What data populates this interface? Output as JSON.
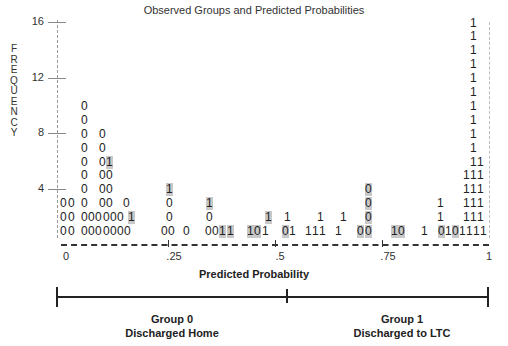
{
  "chart_data": {
    "type": "classification-plot",
    "title": "Observed Groups and Predicted Probabilities",
    "xlabel": "Predicted Probability",
    "ylabel": "FREQUENCY",
    "xlim": [
      0,
      1
    ],
    "ylim": [
      0,
      16
    ],
    "x_ticks": [
      "0",
      ".25",
      ".5",
      ".75",
      "1"
    ],
    "y_ticks": [
      "4",
      "8",
      "12",
      "16"
    ],
    "legend_symbols": {
      "0": "Group 0 (Discharged Home)",
      "1": "Group 1 (Discharged to LTC)"
    },
    "highlight_color": "#c8c8c8",
    "columns": [
      {
        "col": 0,
        "stack": "000"
      },
      {
        "col": 1,
        "stack": "000"
      },
      {
        "col": 2,
        "stack": "0000000000"
      },
      {
        "col": 3,
        "stack": "00"
      },
      {
        "col": 4,
        "stack": "00"
      },
      {
        "col": 5,
        "stack": "00000000"
      },
      {
        "col": 6,
        "stack": "0000001"
      },
      {
        "col": 7,
        "stack": "000"
      },
      {
        "col": 8,
        "stack": "001"
      },
      {
        "col": 13,
        "stack": "0001"
      },
      {
        "col": 14,
        "stack": "0"
      },
      {
        "col": 16,
        "stack": "0"
      },
      {
        "col": 19,
        "stack": "0001"
      },
      {
        "col": 20,
        "stack": "0"
      },
      {
        "col": 21,
        "stack": "1"
      },
      {
        "col": 22,
        "stack": "1"
      },
      {
        "col": 25,
        "stack": "1"
      },
      {
        "col": 26,
        "stack": "0"
      },
      {
        "col": 27,
        "stack": "11"
      },
      {
        "col": 29,
        "stack": "0"
      },
      {
        "col": 30,
        "stack": "11"
      },
      {
        "col": 33,
        "stack": "1"
      },
      {
        "col": 34,
        "stack": "11"
      },
      {
        "col": 35,
        "stack": "1"
      },
      {
        "col": 37,
        "stack": "11"
      },
      {
        "col": 39,
        "stack": "0"
      },
      {
        "col": 40,
        "stack": "0000"
      },
      {
        "col": 44,
        "stack": "1"
      },
      {
        "col": 45,
        "stack": "0"
      },
      {
        "col": 48,
        "stack": "1"
      },
      {
        "col": 50,
        "stack": "0111"
      },
      {
        "col": 51,
        "stack": "1"
      },
      {
        "col": 52,
        "stack": "0"
      },
      {
        "col": 53,
        "stack": "11111111"
      },
      {
        "col": 54,
        "stack": "11111111111111"
      },
      {
        "col": 55,
        "stack": "11111"
      },
      {
        "col": 56,
        "stack": "1"
      }
    ],
    "groups": [
      {
        "range": [
          0,
          0.5
        ],
        "label": "Group 0",
        "sublabel": "Discharged Home"
      },
      {
        "range": [
          0.5,
          1
        ],
        "label": "Group 1",
        "sublabel": "Discharged to LTC"
      }
    ]
  },
  "grid": [
    {
      "x": 84,
      "r": 10,
      "c": "0"
    },
    {
      "x": 84,
      "r": 9,
      "c": "0"
    },
    {
      "x": 84,
      "r": 8,
      "c": "0"
    },
    {
      "x": 84,
      "r": 7,
      "c": "0"
    },
    {
      "x": 84,
      "r": 6,
      "c": "0"
    },
    {
      "x": 84,
      "r": 5,
      "c": "0"
    },
    {
      "x": 84,
      "r": 4,
      "c": "0"
    },
    {
      "x": 84,
      "r": 3,
      "c": "0"
    },
    {
      "x": 84,
      "r": 2,
      "c": "0"
    },
    {
      "x": 84,
      "r": 1,
      "c": "0"
    },
    {
      "x": 63,
      "r": 3,
      "c": "0"
    },
    {
      "x": 63,
      "r": 2,
      "c": "0"
    },
    {
      "x": 63,
      "r": 1,
      "c": "0"
    },
    {
      "x": 71,
      "r": 3,
      "c": "0"
    },
    {
      "x": 71,
      "r": 2,
      "c": "0"
    },
    {
      "x": 71,
      "r": 1,
      "c": "0"
    },
    {
      "x": 91,
      "r": 2,
      "c": "0"
    },
    {
      "x": 91,
      "r": 1,
      "c": "0"
    },
    {
      "x": 98,
      "r": 2,
      "c": "0"
    },
    {
      "x": 98,
      "r": 1,
      "c": "0"
    },
    {
      "x": 102,
      "r": 8,
      "c": "0"
    },
    {
      "x": 102,
      "r": 7,
      "c": "0"
    },
    {
      "x": 102,
      "r": 6,
      "c": "0"
    },
    {
      "x": 102,
      "r": 5,
      "c": "0"
    },
    {
      "x": 102,
      "r": 4,
      "c": "0"
    },
    {
      "x": 102,
      "r": 3,
      "c": "0"
    },
    {
      "x": 106,
      "r": 2,
      "c": "0"
    },
    {
      "x": 106,
      "r": 1,
      "c": "0"
    },
    {
      "x": 109,
      "r": 6,
      "c": "1",
      "hl": true
    },
    {
      "x": 109,
      "r": 5,
      "c": "0"
    },
    {
      "x": 109,
      "r": 4,
      "c": "0"
    },
    {
      "x": 109,
      "r": 3,
      "c": "0"
    },
    {
      "x": 113,
      "r": 2,
      "c": "0"
    },
    {
      "x": 113,
      "r": 1,
      "c": "0"
    },
    {
      "x": 120,
      "r": 2,
      "c": "0"
    },
    {
      "x": 120,
      "r": 1,
      "c": "0"
    },
    {
      "x": 126,
      "r": 3,
      "c": "0"
    },
    {
      "x": 127,
      "r": 1,
      "c": "0"
    },
    {
      "x": 131,
      "r": 2,
      "c": "1",
      "hl": true
    },
    {
      "x": 164,
      "r": 1,
      "c": "0"
    },
    {
      "x": 171,
      "r": 1,
      "c": "0"
    },
    {
      "x": 169,
      "r": 4,
      "c": "1",
      "hl": true
    },
    {
      "x": 169,
      "r": 3,
      "c": "0"
    },
    {
      "x": 169,
      "r": 2,
      "c": "0"
    },
    {
      "x": 186,
      "r": 1,
      "c": "0"
    },
    {
      "x": 208,
      "r": 1,
      "c": "0"
    },
    {
      "x": 215,
      "r": 1,
      "c": "0"
    },
    {
      "x": 209,
      "r": 3,
      "c": "1",
      "hl": true
    },
    {
      "x": 209,
      "r": 2,
      "c": "0"
    },
    {
      "x": 222,
      "r": 1,
      "c": "1",
      "hl": true
    },
    {
      "x": 230,
      "r": 1,
      "c": "1",
      "hl": true
    },
    {
      "x": 250,
      "r": 1,
      "c": "1",
      "hl": true
    },
    {
      "x": 257,
      "r": 1,
      "c": "0",
      "hl": true
    },
    {
      "x": 265,
      "r": 1,
      "c": "1"
    },
    {
      "x": 268,
      "r": 2,
      "c": "1",
      "hl": true
    },
    {
      "x": 285,
      "r": 1,
      "c": "0",
      "hl": true
    },
    {
      "x": 292,
      "r": 1,
      "c": "1"
    },
    {
      "x": 287,
      "r": 2,
      "c": "1"
    },
    {
      "x": 308,
      "r": 1,
      "c": "1"
    },
    {
      "x": 315,
      "r": 1,
      "c": "1"
    },
    {
      "x": 322,
      "r": 1,
      "c": "1"
    },
    {
      "x": 320,
      "r": 2,
      "c": "1"
    },
    {
      "x": 338,
      "r": 1,
      "c": "1"
    },
    {
      "x": 343,
      "r": 2,
      "c": "1"
    },
    {
      "x": 360,
      "r": 1,
      "c": "0",
      "hl": true
    },
    {
      "x": 368,
      "r": 1,
      "c": "0",
      "hl": true
    },
    {
      "x": 368,
      "r": 4,
      "c": "0",
      "hl": true
    },
    {
      "x": 368,
      "r": 3,
      "c": "0",
      "hl": true
    },
    {
      "x": 368,
      "r": 2,
      "c": "0",
      "hl": true
    },
    {
      "x": 394,
      "r": 1,
      "c": "1",
      "hl": true
    },
    {
      "x": 401,
      "r": 1,
      "c": "0",
      "hl": true
    },
    {
      "x": 424,
      "r": 1,
      "c": "1"
    },
    {
      "x": 441,
      "r": 1,
      "c": "0",
      "hl": true
    },
    {
      "x": 448,
      "r": 1,
      "c": "1"
    },
    {
      "x": 455,
      "r": 1,
      "c": "0",
      "hl": true
    },
    {
      "x": 440,
      "r": 3,
      "c": "1"
    },
    {
      "x": 440,
      "r": 2,
      "c": "1"
    },
    {
      "x": 462,
      "r": 1,
      "c": "1"
    },
    {
      "x": 469,
      "r": 1,
      "c": "1"
    },
    {
      "x": 476,
      "r": 1,
      "c": "1"
    },
    {
      "x": 483,
      "r": 1,
      "c": "1"
    },
    {
      "x": 466,
      "r": 5,
      "c": "1"
    },
    {
      "x": 466,
      "r": 4,
      "c": "1"
    },
    {
      "x": 466,
      "r": 3,
      "c": "1"
    },
    {
      "x": 466,
      "r": 2,
      "c": "1"
    },
    {
      "x": 473,
      "r": 16,
      "c": "1"
    },
    {
      "x": 473,
      "r": 15,
      "c": "1"
    },
    {
      "x": 473,
      "r": 14,
      "c": "1"
    },
    {
      "x": 473,
      "r": 13,
      "c": "1"
    },
    {
      "x": 473,
      "r": 12,
      "c": "1"
    },
    {
      "x": 473,
      "r": 11,
      "c": "1"
    },
    {
      "x": 473,
      "r": 10,
      "c": "1"
    },
    {
      "x": 473,
      "r": 9,
      "c": "1"
    },
    {
      "x": 473,
      "r": 8,
      "c": "1"
    },
    {
      "x": 473,
      "r": 7,
      "c": "1"
    },
    {
      "x": 473,
      "r": 6,
      "c": "1"
    },
    {
      "x": 473,
      "r": 5,
      "c": "1"
    },
    {
      "x": 473,
      "r": 4,
      "c": "1"
    },
    {
      "x": 473,
      "r": 3,
      "c": "1"
    },
    {
      "x": 473,
      "r": 2,
      "c": "1"
    },
    {
      "x": 480,
      "r": 6,
      "c": "1"
    },
    {
      "x": 480,
      "r": 5,
      "c": "1"
    },
    {
      "x": 480,
      "r": 4,
      "c": "1"
    },
    {
      "x": 480,
      "r": 3,
      "c": "1"
    },
    {
      "x": 480,
      "r": 2,
      "c": "1"
    }
  ],
  "axis": {
    "y_label_letters": [
      "F",
      "R",
      "E",
      "Q",
      "U",
      "E",
      "N",
      "C",
      "Y"
    ]
  },
  "group_bar": {
    "group0_title": "Group 0",
    "group0_sub": "Discharged Home",
    "group1_title": "Group 1",
    "group1_sub": "Discharged to LTC"
  }
}
